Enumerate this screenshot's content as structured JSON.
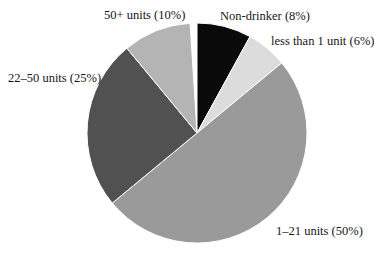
{
  "page": {
    "background_color": "#ffffff",
    "text_color": "#161616"
  },
  "chart_data": {
    "type": "pie",
    "title": "",
    "legend": "none",
    "label_placement": "outside",
    "start_angle_deg": -90,
    "direction": "clockwise",
    "divider_stroke_color": "#ffffff",
    "slices": [
      {
        "name": "Non-drinker",
        "percent": 8,
        "label": "Non-drinker (8%)",
        "color": "#0a0a0a"
      },
      {
        "name": "less than 1 unit",
        "percent": 6,
        "label": "less than 1 unit (6%)",
        "color": "#dcdcdc"
      },
      {
        "name": "1–21 units",
        "percent": 50,
        "label": "1–21 units (50%)",
        "color": "#9a9a9a"
      },
      {
        "name": "22–50 units",
        "percent": 25,
        "label": "22–50 units (25%)",
        "color": "#515151"
      },
      {
        "name": "50+ units",
        "percent": 10,
        "label": "50+ units (10%)",
        "color": "#b4b4b4"
      }
    ]
  }
}
